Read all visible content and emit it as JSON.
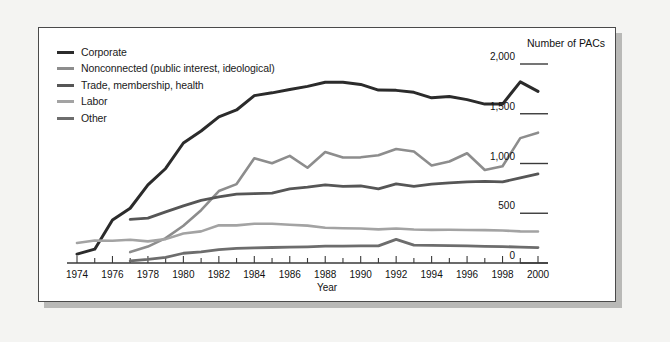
{
  "chart_data": {
    "type": "line",
    "title": "",
    "xlabel": "Year",
    "ylabel": "Number of PACs",
    "grid": false,
    "legend_position": "top-left",
    "xlim": [
      1974,
      2000
    ],
    "ylim": [
      0,
      2000
    ],
    "x_ticks": [
      1974,
      1976,
      1978,
      1980,
      1982,
      1984,
      1986,
      1988,
      1990,
      1992,
      1994,
      1996,
      1998,
      2000
    ],
    "x_tick_labels": [
      "1974",
      "1976",
      "1978",
      "1980",
      "1982",
      "1984",
      "1986",
      "1988",
      "1990",
      "1992",
      "1994",
      "1996",
      "1998",
      "2000"
    ],
    "y_ticks": [
      0,
      500,
      1000,
      1500,
      2000
    ],
    "y_tick_labels": [
      "0",
      "500",
      "1,000",
      "1,500",
      "2,000"
    ],
    "series": [
      {
        "name": "Corporate",
        "color": "#2b2b2b",
        "width": 3.0,
        "x": [
          1974,
          1975,
          1976,
          1977,
          1978,
          1979,
          1980,
          1981,
          1982,
          1983,
          1984,
          1985,
          1986,
          1987,
          1988,
          1989,
          1990,
          1991,
          1992,
          1993,
          1994,
          1995,
          1996,
          1997,
          1998,
          1999,
          2000
        ],
        "values": [
          89,
          139,
          433,
          550,
          785,
          950,
          1206,
          1327,
          1469,
          1538,
          1682,
          1710,
          1744,
          1775,
          1816,
          1816,
          1795,
          1738,
          1735,
          1715,
          1660,
          1674,
          1642,
          1597,
          1597,
          1821,
          1725
        ]
      },
      {
        "name": "Nonconnected (public interest, ideological)",
        "color": "#8d8d8d",
        "width": 2.6,
        "x": [
          1977,
          1978,
          1979,
          1980,
          1981,
          1982,
          1983,
          1984,
          1985,
          1986,
          1987,
          1988,
          1989,
          1990,
          1991,
          1992,
          1993,
          1994,
          1995,
          1996,
          1997,
          1998,
          1999,
          2000
        ],
        "values": [
          110,
          165,
          250,
          374,
          531,
          723,
          793,
          1053,
          1003,
          1077,
          957,
          1115,
          1060,
          1062,
          1083,
          1145,
          1121,
          980,
          1020,
          1103,
          935,
          972,
          1255,
          1310
        ]
      },
      {
        "name": "Trade, membership, health",
        "color": "#565656",
        "width": 2.8,
        "x": [
          1977,
          1978,
          1979,
          1980,
          1981,
          1982,
          1983,
          1984,
          1985,
          1986,
          1987,
          1988,
          1989,
          1990,
          1991,
          1992,
          1993,
          1994,
          1995,
          1996,
          1997,
          1998,
          1999,
          2000
        ],
        "values": [
          438,
          451,
          514,
          574,
          629,
          664,
          693,
          698,
          702,
          745,
          762,
          786,
          770,
          774,
          745,
          795,
          770,
          792,
          805,
          816,
          820,
          815,
          855,
          895
        ]
      },
      {
        "name": "Labor",
        "color": "#a3a3a3",
        "width": 2.6,
        "x": [
          1974,
          1975,
          1976,
          1977,
          1978,
          1979,
          1980,
          1981,
          1982,
          1983,
          1984,
          1985,
          1986,
          1987,
          1988,
          1989,
          1990,
          1991,
          1992,
          1993,
          1994,
          1995,
          1996,
          1997,
          1998,
          1999,
          2000
        ],
        "values": [
          201,
          226,
          224,
          234,
          217,
          240,
          297,
          318,
          380,
          378,
          394,
          394,
          384,
          376,
          354,
          350,
          346,
          338,
          347,
          337,
          333,
          334,
          332,
          330,
          327,
          318,
          316
        ]
      },
      {
        "name": "Other",
        "color": "#6d6d6d",
        "width": 2.8,
        "x": [
          1977,
          1978,
          1979,
          1980,
          1981,
          1982,
          1983,
          1984,
          1985,
          1986,
          1987,
          1988,
          1989,
          1990,
          1991,
          1992,
          1993,
          1994,
          1995,
          1996,
          1997,
          1998,
          1999,
          2000
        ],
        "values": [
          21,
          36,
          56,
          98,
          112,
          135,
          147,
          152,
          156,
          160,
          163,
          169,
          170,
          172,
          172,
          238,
          180,
          178,
          175,
          172,
          168,
          165,
          160,
          155
        ]
      }
    ]
  },
  "legend": {
    "items": [
      {
        "label": "Corporate"
      },
      {
        "label": "Nonconnected (public interest, ideological)"
      },
      {
        "label": "Trade, membership, health"
      },
      {
        "label": "Labor"
      },
      {
        "label": "Other"
      }
    ]
  },
  "axes": {
    "y_title": "Number of PACs",
    "x_title": "Year"
  },
  "colors": {
    "panel_background": "#ffffff",
    "page_background": "#f4f4f2",
    "border": "#4a4a4a",
    "shadow": "#b9b9b7",
    "text": "#1a1a1a"
  }
}
